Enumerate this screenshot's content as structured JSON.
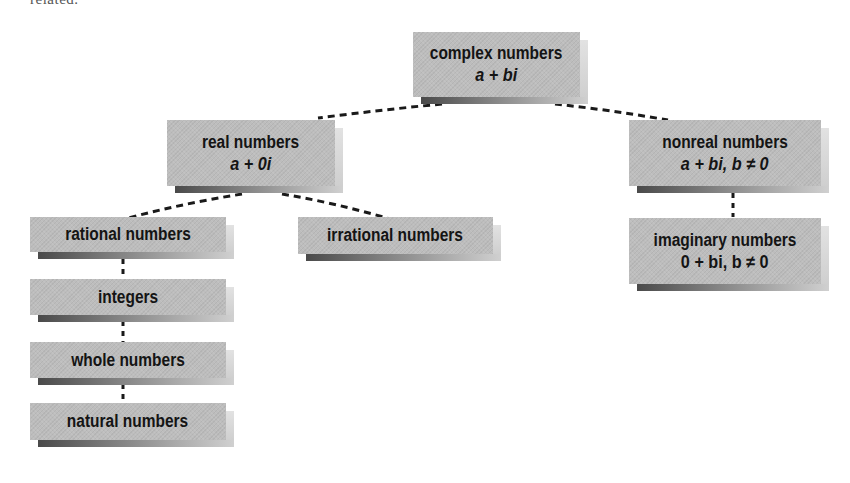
{
  "caption_fragment": "related.",
  "nodes": {
    "complex": {
      "label": "complex numbers",
      "formula": "a + bi"
    },
    "real": {
      "label": "real numbers",
      "formula": "a + 0i"
    },
    "nonreal": {
      "label": "nonreal numbers",
      "formula": "a + bi, b ≠ 0"
    },
    "rational": {
      "label": "rational numbers"
    },
    "irrational": {
      "label": "irrational numbers"
    },
    "imaginary": {
      "label": "imaginary numbers",
      "formula": "0 + bi, b ≠ 0"
    },
    "integers": {
      "label": "integers"
    },
    "whole": {
      "label": "whole numbers"
    },
    "natural": {
      "label": "natural numbers"
    }
  },
  "edges": [
    [
      "complex",
      "real"
    ],
    [
      "complex",
      "nonreal"
    ],
    [
      "real",
      "rational"
    ],
    [
      "real",
      "irrational"
    ],
    [
      "nonreal",
      "imaginary"
    ],
    [
      "rational",
      "integers"
    ],
    [
      "integers",
      "whole"
    ],
    [
      "whole",
      "natural"
    ]
  ],
  "colors": {
    "node_fill": "#bdbdbd",
    "text": "#141414",
    "connector": "#1a1a1a",
    "background": "#ffffff"
  }
}
